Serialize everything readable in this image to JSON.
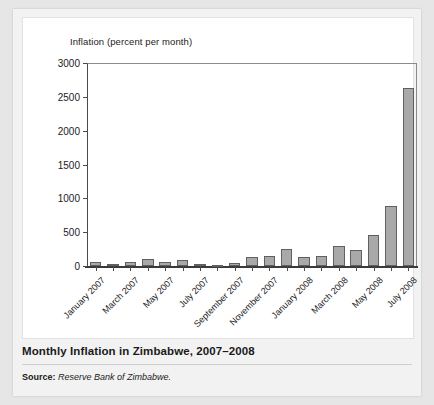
{
  "figure": {
    "caption_title": "Monthly Inflation in Zimbabwe, 2007–2008",
    "source_label": "Source:",
    "source_text": "Reserve Bank of Zimbabwe.",
    "colors": {
      "bar_fill": "#a9a9a9",
      "bar_border": "#606060",
      "axis": "#3a3a3a",
      "card_background": "#f2f2f2",
      "plot_background": "#ffffff",
      "page_background": "#e6e6e6"
    }
  },
  "chart_data": {
    "type": "bar",
    "title": "Monthly Inflation in Zimbabwe, 2007–2008",
    "axis_title": "Inflation (percent per month)",
    "xlabel": "",
    "ylabel": "Inflation (percent per month)",
    "ylim": [
      0,
      3000
    ],
    "yticks": [
      0,
      500,
      1000,
      1500,
      2000,
      2500,
      3000
    ],
    "ytick_labels": [
      "0",
      "500",
      "1000",
      "1500",
      "2000",
      "2500",
      "3000"
    ],
    "grid": false,
    "legend": "none",
    "categories": [
      "January 2007",
      "February 2007",
      "March 2007",
      "April 2007",
      "May 2007",
      "June 2007",
      "July 2007",
      "August 2007",
      "September 2007",
      "October 2007",
      "November 2007",
      "December 2007",
      "January 2008",
      "February 2008",
      "March 2008",
      "April 2008",
      "May 2008",
      "June 2008",
      "July 2008"
    ],
    "xtick_labels": [
      "January 2007",
      "March 2007",
      "May 2007",
      "July 2007",
      "September 2007",
      "November 2007",
      "January 2008",
      "March 2008",
      "May 2008",
      "July 2008"
    ],
    "xtick_label_indices": [
      0,
      2,
      4,
      6,
      8,
      10,
      12,
      14,
      16,
      18
    ],
    "values": [
      55,
      35,
      55,
      100,
      55,
      95,
      30,
      12,
      45,
      140,
      145,
      250,
      140,
      150,
      295,
      235,
      460,
      880,
      2630
    ],
    "units": "percent per month"
  }
}
